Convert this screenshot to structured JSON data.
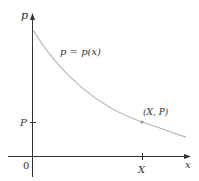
{
  "diagram": {
    "y_axis_label": "p",
    "x_axis_label": "x",
    "origin_label": "0",
    "curve_label": "p = p(x)",
    "point_label": "(X, P)",
    "x_tick_label": "X",
    "y_tick_label": "P",
    "colors": {
      "axis": "#333333",
      "curve": "#b8b8b8",
      "point": "#999999",
      "text": "#333333"
    }
  }
}
